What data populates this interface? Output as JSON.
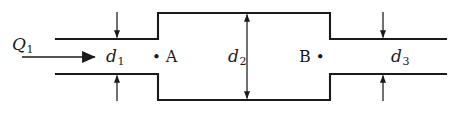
{
  "figure": {
    "background_color": "#ffffff",
    "line_color": "#1a1a1a"
  },
  "labels": {
    "flow_rate": {
      "symbol": "Q",
      "subscript": "1"
    },
    "diameter_1": {
      "symbol": "d",
      "subscript": "1"
    },
    "diameter_2": {
      "symbol": "d",
      "subscript": "2"
    },
    "diameter_3": {
      "symbol": "d",
      "subscript": "3"
    },
    "point_a": "A",
    "point_b": "B",
    "bullet": "•"
  },
  "geometry": {
    "narrow_top_y": 39,
    "narrow_bottom_y": 74,
    "wide_top_y": 13,
    "wide_bottom_y": 100,
    "inlet_start_x": 56,
    "step_left_x": 158,
    "step_right_x": 330,
    "outlet_end_x": 446,
    "flow_arrow_y": 57,
    "flow_arrow_start_x": 22,
    "flow_arrow_end_x": 95,
    "d1_arrow_x": 117,
    "d2_arrow_x": 247,
    "d3_arrow_x": 383
  }
}
